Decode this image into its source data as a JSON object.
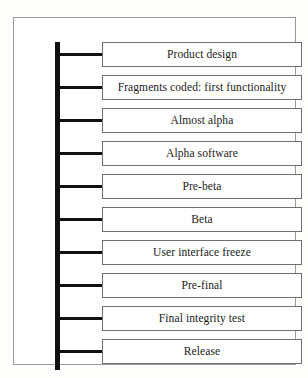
{
  "figure": {
    "type": "software-development-lifecycle-timeline",
    "orientation": "vertical",
    "stage_count": 10,
    "stages": [
      {
        "index": 1,
        "label": "Product design"
      },
      {
        "index": 2,
        "label": "Fragments coded: first functionality"
      },
      {
        "index": 3,
        "label": "Almost alpha"
      },
      {
        "index": 4,
        "label": "Alpha software"
      },
      {
        "index": 5,
        "label": "Pre-beta"
      },
      {
        "index": 6,
        "label": "Beta"
      },
      {
        "index": 7,
        "label": "User interface freeze"
      },
      {
        "index": 8,
        "label": "Pre-final"
      },
      {
        "index": 9,
        "label": "Final integrity test"
      },
      {
        "index": 10,
        "label": "Release"
      }
    ],
    "colors": {
      "page_background": "#fdfdfc",
      "frame_border": "#9a9a96",
      "spine": "#111111",
      "connector": "#111111",
      "box_border": "#6f6f6b",
      "box_fill": "#ffffff",
      "label_text": "#1a1a1a"
    }
  }
}
